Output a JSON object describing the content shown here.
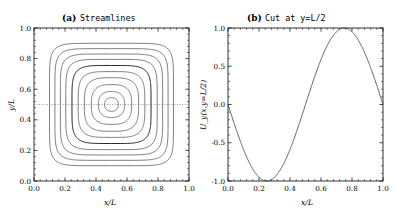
{
  "figure": {
    "panels": [
      {
        "tag": "(a)",
        "title": "Streamlines",
        "xlabel": "x/L",
        "ylabel": "y/L",
        "xticks": [
          "0.0",
          "0.2",
          "0.4",
          "0.6",
          "0.8",
          "1.0"
        ],
        "yticks": [
          "0.0",
          "0.2",
          "0.4",
          "0.6",
          "0.8",
          "1.0"
        ]
      },
      {
        "tag": "(b)",
        "title": "Cut at y=L/2",
        "xlabel": "x/L",
        "ylabel": "U_y(x,y=L/2)",
        "xticks": [
          "0.0",
          "0.2",
          "0.4",
          "0.6",
          "0.8",
          "1.0"
        ],
        "yticks": [
          "1.0",
          "0.5",
          "0.0",
          "-0.5",
          "-1.0"
        ]
      }
    ]
  },
  "chart_data": [
    {
      "type": "line",
      "title": "Streamlines",
      "subtitle": "(a)",
      "xlabel": "x/L",
      "ylabel": "y/L",
      "xlim": [
        0.0,
        1.0
      ],
      "ylim": [
        0.0,
        1.0
      ],
      "xticks": [
        0.0,
        0.2,
        0.4,
        0.6,
        0.8,
        1.0
      ],
      "yticks": [
        0.0,
        0.2,
        0.4,
        0.6,
        0.8,
        1.0
      ],
      "grid": false,
      "legend": "none",
      "description": "Nested closed streamline contours of a single cellular vortex centred at (0.5,0.5); outer contours nearly square with rounded corners, inner contours circular.",
      "center": [
        0.5,
        0.5
      ],
      "contour_count": 10,
      "contour_levels": [
        0.1,
        0.2,
        0.3,
        0.4,
        0.5,
        0.6,
        0.7,
        0.8,
        0.9,
        0.95
      ],
      "contour_half_extent_x": [
        0.4,
        0.365,
        0.33,
        0.295,
        0.255,
        0.215,
        0.175,
        0.13,
        0.085,
        0.045
      ],
      "contour_half_extent_y": [
        0.4,
        0.365,
        0.33,
        0.295,
        0.255,
        0.215,
        0.175,
        0.13,
        0.085,
        0.045
      ],
      "contour_squareness": [
        0.88,
        0.8,
        0.7,
        0.58,
        0.46,
        0.34,
        0.23,
        0.14,
        0.07,
        0.02
      ],
      "emphasised_contour_index": 4,
      "annotations": [
        {
          "type": "dotted-horizontal-line",
          "y": 0.5,
          "x_from": 0.0,
          "x_to": 1.0,
          "meaning": "location of the cut shown in panel (b)"
        }
      ]
    },
    {
      "type": "line",
      "title": "Cut at y=L/2",
      "subtitle": "(b)",
      "xlabel": "x/L",
      "ylabel": "U_y(x,y=L/2)",
      "xlim": [
        0.0,
        1.0
      ],
      "ylim": [
        -1.0,
        1.0
      ],
      "xticks": [
        0.0,
        0.2,
        0.4,
        0.6,
        0.8,
        1.0
      ],
      "yticks": [
        -1.0,
        -0.5,
        0.0,
        0.5,
        1.0
      ],
      "grid": false,
      "legend": "none",
      "description": "Vertical velocity component along the horizontal cut y=L/2; a full negative sine period, minimum -1 at x/L=0.25 and maximum +1 at x/L=0.75.",
      "function": "U_y = -sin(2*pi*x/L)",
      "x": [
        0.0,
        0.05,
        0.1,
        0.15,
        0.2,
        0.25,
        0.3,
        0.35,
        0.4,
        0.45,
        0.5,
        0.55,
        0.6,
        0.65,
        0.7,
        0.75,
        0.8,
        0.85,
        0.9,
        0.95,
        1.0
      ],
      "values": [
        0.0,
        -0.309,
        -0.588,
        -0.809,
        -0.951,
        -1.0,
        -0.951,
        -0.809,
        -0.588,
        -0.309,
        0.0,
        0.309,
        0.588,
        0.809,
        0.951,
        1.0,
        0.951,
        0.809,
        0.588,
        0.309,
        0.0
      ],
      "key_points": [
        {
          "x": 0.0,
          "y": 0.0,
          "label": "zero"
        },
        {
          "x": 0.25,
          "y": -1.0,
          "label": "minimum"
        },
        {
          "x": 0.5,
          "y": 0.0,
          "label": "zero"
        },
        {
          "x": 0.75,
          "y": 1.0,
          "label": "maximum"
        },
        {
          "x": 1.0,
          "y": 0.0,
          "label": "zero"
        }
      ]
    }
  ]
}
